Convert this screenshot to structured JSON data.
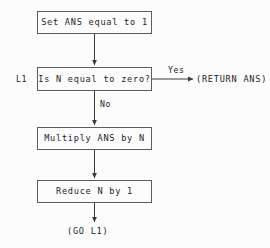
{
  "diagram": {
    "colors": {
      "background": "#fcfcfc",
      "stroke": "#5c5c5c",
      "text": "#1c1c1c",
      "arrow": "#3a3a3a"
    },
    "nodes": [
      {
        "id": "init",
        "label": "Set ANS equal to 1",
        "shape": "rect"
      },
      {
        "id": "test",
        "label": "Is N equal to zero?",
        "shape": "rect"
      },
      {
        "id": "multiply",
        "label": "Multiply ANS by N",
        "shape": "rect"
      },
      {
        "id": "decrement",
        "label": "Reduce N by 1",
        "shape": "rect"
      }
    ],
    "labels": {
      "loop_tag": "L1",
      "branch_yes": "Yes",
      "branch_no": "No"
    },
    "terminals": [
      {
        "id": "return",
        "label": "(RETURN ANS)"
      },
      {
        "id": "goto",
        "label": "(GO L1)"
      }
    ]
  }
}
